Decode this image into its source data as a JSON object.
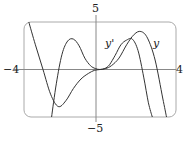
{
  "chart_data": {
    "type": "line",
    "title": "",
    "xlabel": "",
    "ylabel": "",
    "xlim": [
      -4,
      4
    ],
    "ylim": [
      -5,
      5
    ],
    "grid": false,
    "legend": "inline labels",
    "tick_labels": {
      "x_min": "−4",
      "x_max": "4",
      "y_max": "5",
      "y_min": "−5"
    },
    "series": [
      {
        "name": "y",
        "x": [
          -3.75,
          -3.4,
          -3.0,
          -2.6,
          -2.2,
          -1.8,
          -1.4,
          -1.0,
          -0.6,
          -0.3,
          0.0,
          0.3,
          0.6,
          1.0,
          1.4,
          1.8,
          2.15,
          2.5,
          2.9,
          3.3,
          3.5
        ],
        "y": [
          5.0,
          2.6,
          0.0,
          -2.6,
          -3.9,
          -3.3,
          -2.0,
          -1.0,
          -0.4,
          -0.1,
          0.0,
          0.1,
          0.4,
          1.2,
          2.6,
          3.7,
          4.0,
          3.3,
          1.0,
          -3.0,
          -5.0
        ]
      },
      {
        "name": "y'",
        "x": [
          -2.55,
          -2.3,
          -2.0,
          -1.7,
          -1.4,
          -1.1,
          -0.8,
          -0.5,
          -0.25,
          0.0,
          0.25,
          0.5,
          0.8,
          1.1,
          1.4,
          1.7,
          2.0,
          2.3,
          2.55,
          2.75
        ],
        "y": [
          -5.0,
          -1.5,
          1.6,
          3.0,
          3.2,
          2.5,
          1.2,
          0.4,
          0.1,
          0.0,
          0.1,
          0.5,
          1.5,
          2.6,
          3.1,
          3.2,
          2.0,
          -0.8,
          -3.5,
          -5.0
        ]
      }
    ],
    "annotations": [
      {
        "text": "y'",
        "x": 0.9,
        "y": 2.8
      },
      {
        "text": "y",
        "x": 3.0,
        "y": 2.8
      }
    ]
  }
}
